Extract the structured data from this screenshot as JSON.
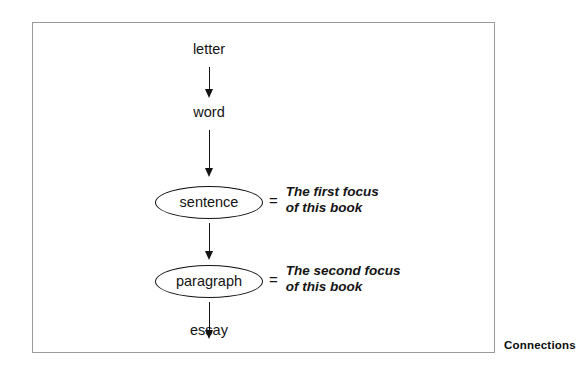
{
  "figure": {
    "caption": "Connections",
    "flow": {
      "nodes": [
        {
          "id": "letter",
          "label": "letter",
          "shape": "plain"
        },
        {
          "id": "word",
          "label": "word",
          "shape": "plain"
        },
        {
          "id": "sentence",
          "label": "sentence",
          "shape": "ellipse"
        },
        {
          "id": "paragraph",
          "label": "paragraph",
          "shape": "ellipse"
        },
        {
          "id": "essay",
          "label": "essay",
          "shape": "plain"
        }
      ],
      "edges": [
        {
          "from": "letter",
          "to": "word",
          "style": "arrow-down"
        },
        {
          "from": "word",
          "to": "sentence",
          "style": "arrow-down"
        },
        {
          "from": "sentence",
          "to": "paragraph",
          "style": "arrow-down"
        },
        {
          "from": "paragraph",
          "to": "essay",
          "style": "arrow-down"
        }
      ]
    },
    "annotations": [
      {
        "target": "sentence",
        "equals": "=",
        "line1": "The first focus",
        "line2": "of this book"
      },
      {
        "target": "paragraph",
        "equals": "=",
        "line1": "The second focus",
        "line2": "of this book"
      }
    ]
  },
  "colors": {
    "ink": "#131313",
    "frame_border": "#9a9a9a",
    "background": "#ffffff"
  }
}
